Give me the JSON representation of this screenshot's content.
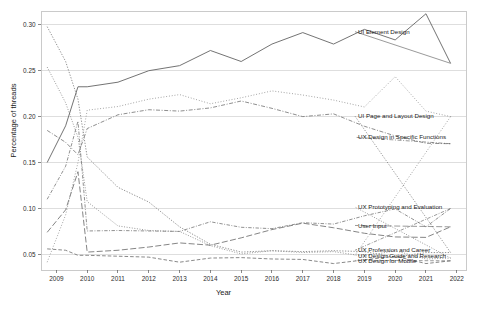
{
  "chart_data": {
    "type": "line",
    "title": "",
    "xlabel": "Year",
    "ylabel": "Percentage of threads",
    "xlim": [
      2008.5,
      2022.3
    ],
    "ylim": [
      0.033,
      0.315
    ],
    "xticks": [
      2009,
      2010,
      2011,
      2012,
      2013,
      2014,
      2015,
      2016,
      2017,
      2018,
      2019,
      2020,
      2021,
      2022
    ],
    "yticks": [
      0.05,
      0.1,
      0.15,
      0.2,
      0.25,
      0.3
    ],
    "ytick_labels": [
      "0.05",
      "0.10",
      "0.15",
      "0.20",
      "0.25",
      "0.30"
    ],
    "grid": "horizontal",
    "legend": "inline-right-labels",
    "x": [
      2008.7,
      2009.3,
      2009.7,
      2010,
      2011,
      2012,
      2013,
      2014,
      2015,
      2016,
      2017,
      2018,
      2019,
      2020,
      2021,
      2021.8
    ],
    "series": [
      {
        "name": "UI Element Design",
        "label_y": 0.2925,
        "dash": "solid",
        "color": "#6b6b6b",
        "values": [
          0.15,
          0.19,
          0.2325,
          0.2325,
          0.2375,
          0.25,
          0.2555,
          0.272,
          0.26,
          0.279,
          0.2915,
          0.279,
          0.295,
          0.2835,
          0.312,
          0.258
        ]
      },
      {
        "name": "UI Page and Layout Design",
        "label_y": 0.2005,
        "dash": "dotted",
        "color": "#808080",
        "values": [
          0.298,
          0.26,
          0.219,
          0.156,
          0.123,
          0.107,
          0.08,
          0.061,
          0.0525,
          0.054,
          0.053,
          0.054,
          0.053,
          0.047,
          0.052,
          0.052
        ]
      },
      {
        "name": "UX Design in Specific Functions",
        "label_y": 0.1775,
        "dash": "dashdot",
        "color": "#7a7a7a",
        "values": [
          0.185,
          0.172,
          0.1585,
          0.187,
          0.202,
          0.2075,
          0.206,
          0.2095,
          0.217,
          0.209,
          0.2,
          0.203,
          0.1895,
          0.179,
          0.171,
          0.1705
        ]
      },
      {
        "name": "UX Prototyping and Evaluation",
        "label_y": 0.1015,
        "dash": "dotted-fine",
        "color": "#888888",
        "values": [
          0.254,
          0.215,
          0.1775,
          0.1075,
          0.081,
          0.076,
          0.075,
          0.0595,
          0.0505,
          0.054,
          0.052,
          0.053,
          0.048,
          0.054,
          0.045,
          0.046
        ]
      },
      {
        "name": "User Input",
        "label_y": 0.0815,
        "dash": "longdash",
        "color": "#6f6f6f",
        "values": [
          0.074,
          0.0985,
          0.14,
          0.0525,
          0.0545,
          0.058,
          0.0625,
          0.06,
          0.068,
          0.077,
          0.084,
          0.079,
          0.073,
          0.069,
          0.0685,
          0.08
        ]
      },
      {
        "name": "UX Profession and Career",
        "label_y": 0.0545,
        "dash": "dashdot-fine",
        "color": "#7d7d7d",
        "values": [
          0.11,
          0.146,
          0.195,
          0.0755,
          0.076,
          0.0755,
          0.075,
          0.0855,
          0.0795,
          0.078,
          0.0845,
          0.083,
          0.092,
          0.0995,
          0.08,
          0.1
        ]
      },
      {
        "name": "UX Design Guide and Research",
        "label_y": 0.049,
        "dash": "dotted-sparse",
        "color": "#8a8a8a",
        "values": [
          0.0415,
          0.093,
          0.15,
          0.207,
          0.211,
          0.219,
          0.224,
          0.214,
          0.2205,
          0.228,
          0.2235,
          0.218,
          0.2105,
          0.2435,
          0.206,
          0.2
        ]
      },
      {
        "name": "UX Design for Mobile",
        "label_y": 0.0435,
        "dash": "mediumdash",
        "color": "#747474",
        "values": [
          0.056,
          0.0545,
          0.049,
          0.049,
          0.048,
          0.047,
          0.0415,
          0.046,
          0.0465,
          0.045,
          0.0445,
          0.04,
          0.044,
          0.048,
          0.04,
          0.043
        ]
      }
    ]
  },
  "plot": {
    "left": 41,
    "right": 466,
    "top": 11,
    "bottom": 270
  },
  "dash_patterns": {
    "solid": "none",
    "dotted": "1.3,1.5",
    "dotted-fine": "1,1.6",
    "dotted-sparse": "0.9,1.9",
    "dashdot": "4,1.6,1,1.6",
    "dashdot-fine": "3.4,1.5,0.9,1.5",
    "longdash": "6,2.4",
    "mediumdash": "3.6,2"
  }
}
